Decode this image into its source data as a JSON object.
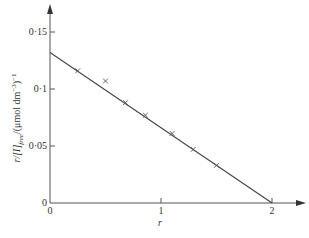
{
  "chart_data": {
    "type": "scatter",
    "title": "",
    "xlabel": "r",
    "ylabel": "r/[I]free/(μmol dm⁻³)⁻¹",
    "ylabel_parts": {
      "main": "r/[I]",
      "subscript": "free",
      "rest": "/(μmol dm",
      "superscript": "−3",
      "close": ")",
      "outer_sup": "−1"
    },
    "xlim": [
      0,
      2.2
    ],
    "ylim": [
      0,
      0.16
    ],
    "x_ticks": [
      {
        "value": 0,
        "label": "0"
      },
      {
        "value": 1,
        "label": "1"
      },
      {
        "value": 2,
        "label": "2"
      }
    ],
    "y_ticks": [
      {
        "value": 0,
        "label": "0"
      },
      {
        "value": 0.05,
        "label": "0·05"
      },
      {
        "value": 0.1,
        "label": "0·1"
      },
      {
        "value": 0.15,
        "label": "0·15"
      }
    ],
    "grid": false,
    "marker": "x",
    "points": [
      {
        "x": 0.25,
        "y": 0.116
      },
      {
        "x": 0.5,
        "y": 0.107
      },
      {
        "x": 0.68,
        "y": 0.088
      },
      {
        "x": 0.86,
        "y": 0.077
      },
      {
        "x": 1.1,
        "y": 0.061
      },
      {
        "x": 1.29,
        "y": 0.047
      },
      {
        "x": 1.5,
        "y": 0.033
      }
    ],
    "fit_line": {
      "x": [
        0,
        2
      ],
      "y": [
        0.132,
        0
      ]
    },
    "colors": {
      "axis": "#555555",
      "line": "#444444",
      "marker": "#555555"
    }
  }
}
